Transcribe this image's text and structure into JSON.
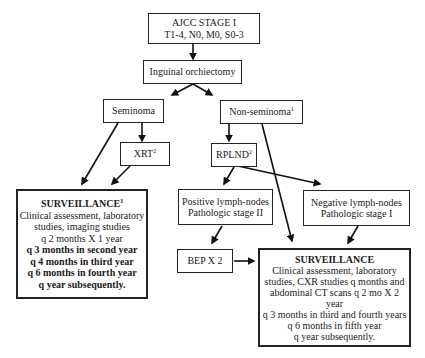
{
  "nodes": {
    "stage": {
      "line1": "AJCC STAGE I",
      "line2": "T1-4, N0, M0, S0-3"
    },
    "orchiectomy": {
      "label": "Inguinal orchiectomy"
    },
    "seminoma": {
      "label": "Seminoma"
    },
    "nonseminoma": {
      "label": "Non-seminoma",
      "footnote": "1"
    },
    "xrt": {
      "label": "XRT",
      "footnote": "2"
    },
    "rplnd": {
      "label": "RPLND",
      "footnote": "2"
    },
    "positive": {
      "line1": "Positive lymph-nodes",
      "line2": "Pathologic stage II"
    },
    "negative": {
      "line1": "Negative lymph-nodes",
      "line2": "Pathologic stage I"
    },
    "bep": {
      "label": "BEP X 2"
    },
    "surveillance_seminoma": {
      "title": "SURVEILLANCE",
      "footnote": "3",
      "lines": [
        "Clinical assessment, laboratory",
        "studies, imaging studies",
        "q 2 months X 1 year"
      ],
      "bold_lines": [
        "q 3 months in second year",
        "q 4 months in third year",
        "q 6 months in fourth year",
        "q year subsequently."
      ]
    },
    "surveillance_nonseminoma": {
      "title": "SURVEILLANCE",
      "lines": [
        "Clinical assessment, laboratory",
        "studies, CXR studies q months and",
        "abdominal CT scans q 2 mo X 2",
        "year",
        "q 3 months in third and fourth years",
        "q 6 months in fifth year",
        "q year subsequently."
      ]
    }
  }
}
